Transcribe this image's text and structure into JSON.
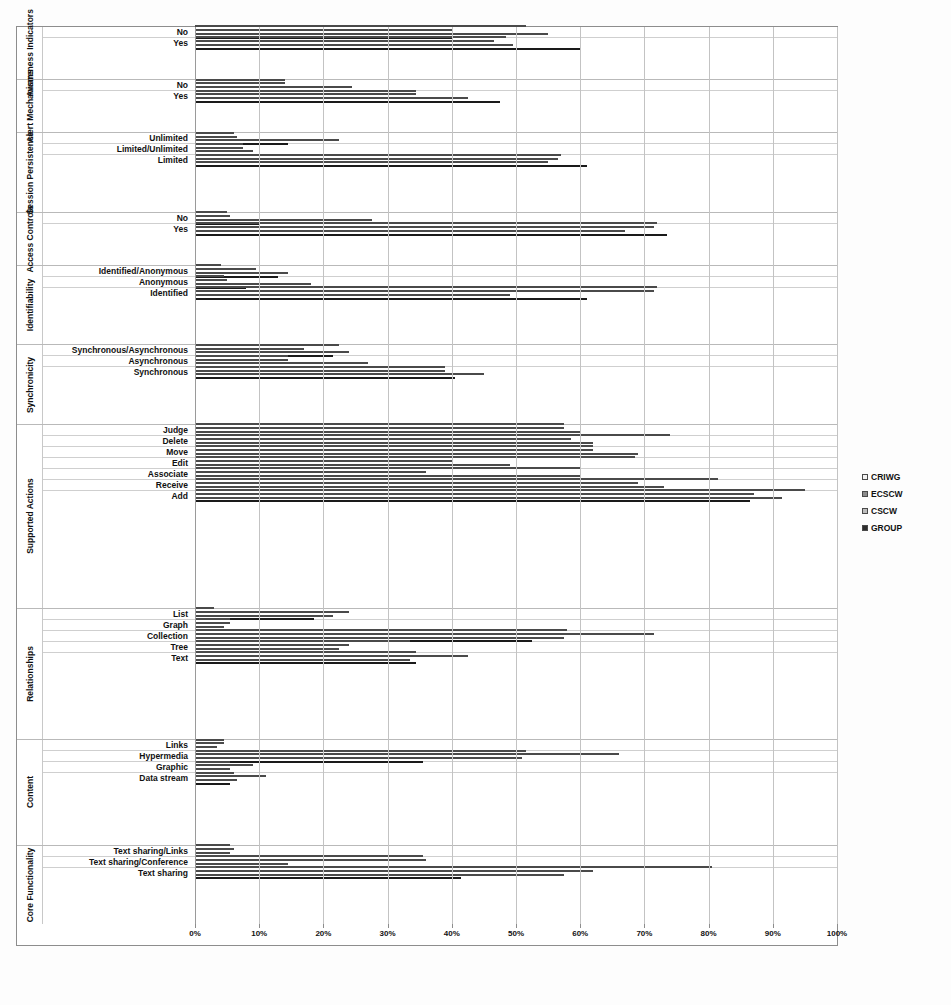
{
  "legend": {
    "position": "right",
    "items": [
      {
        "label": "CRIWG",
        "color": "#f3f3f3"
      },
      {
        "label": "ECSCW",
        "color": "#8c8c8c"
      },
      {
        "label": "CSCW",
        "color": "#bdbdbd"
      },
      {
        "label": "GROUP",
        "color": "#2e2e2e"
      }
    ]
  },
  "axis": {
    "ticks": [
      "0%",
      "10%",
      "20%",
      "30%",
      "40%",
      "50%",
      "60%",
      "70%",
      "80%",
      "90%",
      "100%"
    ]
  },
  "caption": "",
  "chart_data": {
    "type": "bar",
    "orientation": "horizontal",
    "title": "",
    "xlabel": "",
    "ylabel": "",
    "xlim": [
      0,
      100
    ],
    "grid": true,
    "legend_position": "right",
    "series_names": [
      "CRIWG",
      "ECSCW",
      "CSCW",
      "GROUP"
    ],
    "groups": [
      {
        "name": "Awareness Indicators",
        "rows": [
          {
            "category": "No",
            "values": [
              51.5,
              40.0,
              55.0,
              40.0
            ]
          },
          {
            "category": "Yes",
            "values": [
              48.5,
              46.5,
              49.5,
              60.0
            ]
          }
        ]
      },
      {
        "name": "Alert Mechanisms",
        "rows": [
          {
            "category": "No",
            "values": [
              14.0,
              14.0,
              24.5,
              8.5
            ]
          },
          {
            "category": "Yes",
            "values": [
              34.5,
              34.5,
              42.5,
              47.5
            ]
          }
        ]
      },
      {
        "name": "Session Persistence",
        "rows": [
          {
            "category": "Unlimited",
            "values": [
              6.0,
              6.5,
              22.5,
              14.5
            ]
          },
          {
            "category": "Limited/Unlimited",
            "values": [
              7.5,
              7.5,
              9.0,
              13.0
            ]
          },
          {
            "category": "Limited",
            "values": [
              57.0,
              56.5,
              55.0,
              61.0
            ]
          }
        ]
      },
      {
        "name": "Access Controls",
        "rows": [
          {
            "category": "No",
            "values": [
              5.0,
              5.5,
              27.5,
              10.0
            ]
          },
          {
            "category": "Yes",
            "values": [
              72.0,
              71.5,
              67.0,
              73.5
            ]
          }
        ]
      },
      {
        "name": "Identifiability",
        "rows": [
          {
            "category": "Identified/Anonymous",
            "values": [
              4.0,
              9.5,
              14.5,
              13.0
            ]
          },
          {
            "category": "Anonymous",
            "values": [
              4.5,
              5.0,
              18.0,
              8.0
            ]
          },
          {
            "category": "Identified",
            "values": [
              72.0,
              71.5,
              49.0,
              61.0
            ]
          }
        ]
      },
      {
        "name": "Synchronicity",
        "rows": [
          {
            "category": "Synchronous/Asynchronous",
            "values": [
              22.5,
              17.0,
              24.0,
              21.5
            ]
          },
          {
            "category": "Asynchronous",
            "values": [
              14.5,
              14.5,
              27.0,
              26.0
            ]
          },
          {
            "category": "Synchronous",
            "values": [
              39.0,
              39.0,
              45.0,
              40.5
            ]
          }
        ]
      },
      {
        "name": "Supported Actions",
        "rows": [
          {
            "category": "Judge",
            "values": [
              57.5,
              57.5,
              60.0,
              60.0
            ]
          },
          {
            "category": "Delete",
            "values": [
              74.0,
              58.5,
              62.0,
              59.5
            ]
          },
          {
            "category": "Move",
            "values": [
              62.0,
              62.0,
              69.0,
              53.5
            ]
          },
          {
            "category": "Edit",
            "values": [
              68.5,
              40.0,
              49.0,
              55.5
            ]
          },
          {
            "category": "Associate",
            "values": [
              60.0,
              36.0,
              60.0,
              53.0
            ]
          },
          {
            "category": "Receive",
            "values": [
              81.5,
              69.0,
              73.0,
              72.0
            ]
          },
          {
            "category": "Add",
            "values": [
              95.0,
              87.0,
              91.5,
              86.5
            ]
          }
        ]
      },
      {
        "name": "Relationships",
        "rows": [
          {
            "category": "List",
            "values": [
              3.0,
              24.0,
              21.5,
              18.5
            ]
          },
          {
            "category": "Graph",
            "values": [
              5.5,
              5.5,
              4.5,
              7.5
            ]
          },
          {
            "category": "Collection",
            "values": [
              58.0,
              71.5,
              57.5,
              52.5
            ]
          },
          {
            "category": "Tree",
            "values": [
              33.5,
              24.0,
              22.5,
              20.0
            ]
          },
          {
            "category": "Text",
            "values": [
              34.5,
              42.5,
              33.5,
              34.5
            ]
          }
        ]
      },
      {
        "name": "Content",
        "rows": [
          {
            "category": "Links",
            "values": [
              4.5,
              4.5,
              3.5,
              4.0
            ]
          },
          {
            "category": "Hypermedia",
            "values": [
              51.5,
              66.0,
              51.0,
              35.5
            ]
          },
          {
            "category": "Graphic",
            "values": [
              5.5,
              9.0,
              5.5,
              2.5
            ]
          },
          {
            "category": "Data stream",
            "values": [
              6.0,
              11.0,
              6.5,
              5.5
            ]
          }
        ]
      },
      {
        "name": "Core Functionality",
        "rows": [
          {
            "category": "Text sharing/Links",
            "values": [
              5.5,
              6.0,
              5.5,
              23.5
            ]
          },
          {
            "category": "Text sharing/Conference",
            "values": [
              35.5,
              36.0,
              14.5,
              35.0
            ]
          },
          {
            "category": "Text sharing",
            "values": [
              80.5,
              62.0,
              57.5,
              41.5
            ]
          }
        ]
      }
    ]
  }
}
